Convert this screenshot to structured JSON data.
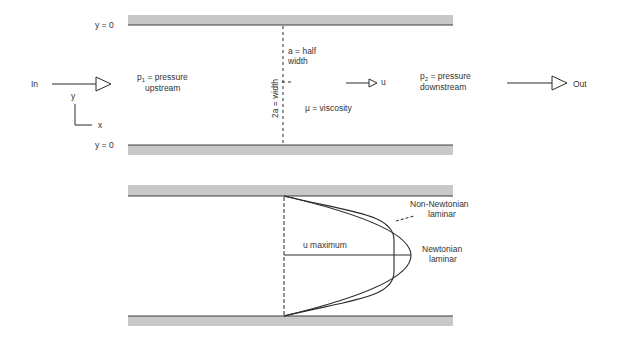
{
  "top_diagram": {
    "wall_top_label": "y = 0",
    "wall_bottom_label": "y = 0",
    "inlet_label": "In",
    "outlet_label": "Out",
    "axis_y_label": "y",
    "axis_x_label": "x",
    "upstream_label_p": "p",
    "upstream_label_sub": "1",
    "upstream_label_rest": " = pressure",
    "upstream_label_line2": "upstream",
    "downstream_label_p": "p",
    "downstream_label_sub": "2",
    "downstream_label_rest": " = pressure",
    "downstream_label_line2": "downstream",
    "half_width_line1": "a = half",
    "half_width_line2": "width",
    "full_width_label": "2a = width",
    "viscosity_label": "μ = viscosity",
    "velocity_label": "u"
  },
  "bottom_diagram": {
    "u_max_label": "u maximum",
    "non_newtonian_line1": "Non-Newtonian",
    "non_newtonian_line2": "laminar",
    "newtonian_line1": "Newtonian",
    "newtonian_line2": "laminar"
  },
  "colors": {
    "wall_fill": "#c8c8c8",
    "wall_edge": "#3a3a3a",
    "line": "#2a2a2a",
    "text": "#333333"
  }
}
